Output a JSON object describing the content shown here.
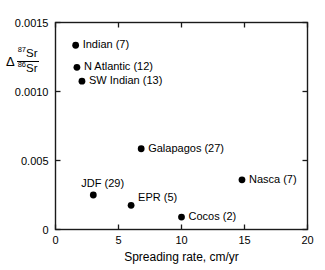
{
  "chart_data": {
    "type": "scatter",
    "title": "",
    "xlabel": "Spreading rate, cm/yr",
    "ylabel_delta": "Δ",
    "ylabel_numerator_mass": "87",
    "ylabel_numerator_element": "Sr",
    "ylabel_denominator_mass": "86",
    "ylabel_denominator_element": "Sr",
    "xlim": [
      0,
      20
    ],
    "ylim": [
      0,
      0.0015
    ],
    "xticks": [
      0,
      5,
      10,
      15,
      20
    ],
    "xtick_labels": [
      "0",
      "5",
      "10",
      "15",
      "20"
    ],
    "yticks": [
      0,
      0.0005,
      0.001,
      0.0015
    ],
    "ytick_labels": [
      "0",
      "0.005",
      "0.0010",
      "0.0015"
    ],
    "grid": false,
    "legend": "none",
    "points": [
      {
        "label": "Indian (7)",
        "name": "Indian",
        "n": 7,
        "x": 1.6,
        "y": 0.001335,
        "label_pos": "right"
      },
      {
        "label": "N Atlantic (12)",
        "name": "N Atlantic",
        "n": 12,
        "x": 1.7,
        "y": 0.001175,
        "label_pos": "right"
      },
      {
        "label": "SW Indian (13)",
        "name": "SW Indian",
        "n": 13,
        "x": 2.1,
        "y": 0.001075,
        "label_pos": "right"
      },
      {
        "label": "Galapagos (27)",
        "name": "Galapagos",
        "n": 27,
        "x": 6.8,
        "y": 0.000585,
        "label_pos": "right"
      },
      {
        "label": "Nasca (7)",
        "name": "Nasca",
        "n": 7,
        "x": 14.8,
        "y": 0.00036,
        "label_pos": "right"
      },
      {
        "label": "JDF (29)",
        "name": "JDF",
        "n": 29,
        "x": 3.0,
        "y": 0.00025,
        "label_pos": "above"
      },
      {
        "label": "EPR (5)",
        "name": "EPR",
        "n": 5,
        "x": 6.0,
        "y": 0.000175,
        "label_pos": "right-up"
      },
      {
        "label": "Cocos (2)",
        "name": "Cocos",
        "n": 2,
        "x": 10.0,
        "y": 9e-05,
        "label_pos": "right"
      }
    ]
  },
  "figure": {
    "background_color": "#ffffff",
    "marker_color": "#000000",
    "axis_color": "#1a1a1a"
  }
}
